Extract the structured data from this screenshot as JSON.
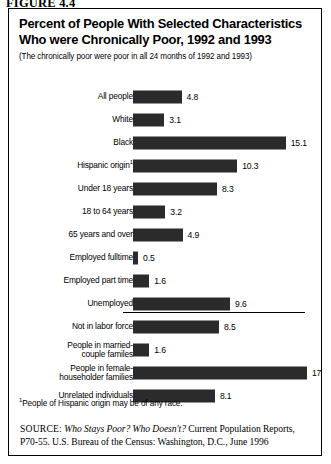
{
  "figure_label": "FIGURE 4.4",
  "title": "Percent of People With Selected Characteristics Who were Chronically Poor, 1992 and 1993",
  "subtitle": "(The chronically poor were poor in all 24 months of 1992 and 1993)",
  "footnote": {
    "marker": "1",
    "text": "People of Hispanic origin may be of any race."
  },
  "source": {
    "tag": "SOURCE:",
    "title": "Who Stays Poor? Who Doesn't?",
    "rest": " Current Population Reports, P70-55. U.S. Bureau of the Census: Washington, D.C., June 1996"
  },
  "colors": {
    "bar": "#2b2b2b",
    "frame": "#000000",
    "background": "#ffffff"
  },
  "chart_data": {
    "type": "bar",
    "orientation": "horizontal",
    "title": "Percent of People With Selected Characteristics Who were Chronically Poor, 1992 and 1993",
    "subtitle": "(The chronically poor were poor in all 24 months of 1992 and 1993)",
    "xlabel": "",
    "ylabel": "",
    "xlim": [
      0,
      18
    ],
    "grid": false,
    "legend": null,
    "units": "percent",
    "categories": [
      "All people",
      "White",
      "Black",
      "Hispanic origin",
      "Under 18 years",
      "18 to 64 years",
      "65 years and over",
      "Employed fulltime",
      "Employed part time",
      "Unemployed",
      "Not in labor force",
      "People in married-couple familes",
      "People in female-householder families",
      "Unrelated individuals"
    ],
    "values": [
      4.8,
      3.1,
      15.1,
      10.3,
      8.3,
      3.2,
      4.9,
      0.5,
      1.6,
      9.6,
      8.5,
      1.6,
      17.2,
      8.1
    ],
    "value_labels": [
      "4.8",
      "3.1",
      "15.1",
      "10.3",
      "8.3",
      "3.2",
      "4.9",
      "0.5",
      "1.6",
      "9.6",
      "8.5",
      "1.6",
      "17.2",
      "8.1"
    ],
    "category_footnote_markers": [
      "",
      "",
      "",
      "1",
      "",
      "",
      "",
      "",
      "",
      "",
      "",
      "",
      "",
      ""
    ],
    "category_line_breaks": {
      "11": [
        "People in married-",
        "couple familes"
      ],
      "12": [
        "People in female-",
        "householder families"
      ]
    }
  }
}
